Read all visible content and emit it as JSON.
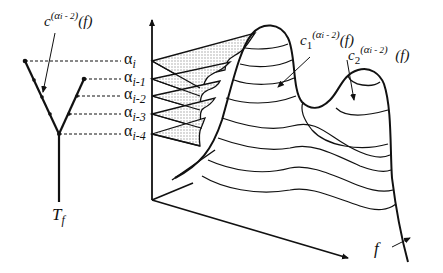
{
  "figure": {
    "tree_label": {
      "base": "T",
      "subscript": "f"
    },
    "feature_axis_label": "f",
    "tree_node_label": {
      "base": "c",
      "subscript": "1",
      "superscript": "(α",
      "superscript_index": "i - 2",
      "superscript_close": ")",
      "arg": "(f)"
    },
    "peak1_label": {
      "base": "c",
      "subscript": "1",
      "superscript": "(α",
      "superscript_index": "i - 2",
      "superscript_close": ")",
      "arg": "(f)"
    },
    "peak2_label": {
      "base": "c",
      "subscript": "2",
      "superscript": "(α",
      "superscript_index": "i - 2",
      "superscript_close": ")",
      "arg": "(f)"
    },
    "levels": [
      {
        "symbol": "α",
        "index": "i"
      },
      {
        "symbol": "α",
        "index": "i-1"
      },
      {
        "symbol": "α",
        "index": "i-2"
      },
      {
        "symbol": "α",
        "index": "i-3"
      },
      {
        "symbol": "α",
        "index": "i-4"
      }
    ],
    "colors": {
      "ink": "#111111",
      "hatch": "#d9d9d9",
      "background": "#ffffff"
    }
  }
}
